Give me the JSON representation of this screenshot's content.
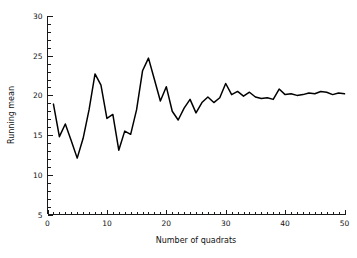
{
  "chart_data": {
    "type": "line",
    "title": "",
    "xlabel": "Number of quadrats",
    "ylabel": "Running mean",
    "xlim": [
      0,
      50
    ],
    "ylim": [
      5,
      30
    ],
    "grid": false,
    "legend": null,
    "x_ticks": [
      0,
      10,
      20,
      30,
      40,
      50
    ],
    "x_tick_labels": [
      "0",
      "10",
      "20",
      "30",
      "40",
      "50"
    ],
    "x_minor_tick_interval": 1,
    "y_ticks": [
      5,
      10,
      15,
      20,
      25,
      30
    ],
    "y_tick_labels": [
      "5",
      "10",
      "15",
      "20",
      "25",
      "30"
    ],
    "y_minor_tick_interval": 1,
    "line_color": "#000000",
    "background_color": "#ffffff",
    "series": [
      {
        "name": "Running mean",
        "x": [
          1,
          2,
          3,
          4,
          5,
          6,
          7,
          8,
          9,
          10,
          11,
          12,
          13,
          14,
          15,
          16,
          17,
          18,
          19,
          20,
          21,
          22,
          23,
          24,
          25,
          26,
          27,
          28,
          29,
          30,
          31,
          32,
          33,
          34,
          35,
          36,
          37,
          38,
          39,
          40,
          41,
          42,
          43,
          44,
          45,
          46,
          47,
          48,
          49,
          50
        ],
        "values": [
          18.9,
          14.8,
          16.4,
          14.3,
          12.1,
          14.6,
          18.2,
          22.7,
          21.3,
          17.1,
          17.6,
          13.1,
          15.5,
          15.1,
          18.2,
          23.1,
          24.7,
          22.0,
          19.3,
          21.1,
          18.0,
          16.9,
          18.4,
          19.5,
          17.8,
          19.1,
          19.8,
          19.1,
          19.7,
          21.5,
          20.1,
          20.5,
          19.9,
          20.4,
          19.8,
          19.6,
          19.7,
          19.5,
          20.8,
          20.1,
          20.2,
          20.0,
          20.1,
          20.3,
          20.2,
          20.5,
          20.4,
          20.1,
          20.3,
          20.2
        ]
      }
    ]
  },
  "axis": {
    "x_title": "Number of quadrats",
    "y_title": "Running mean"
  }
}
